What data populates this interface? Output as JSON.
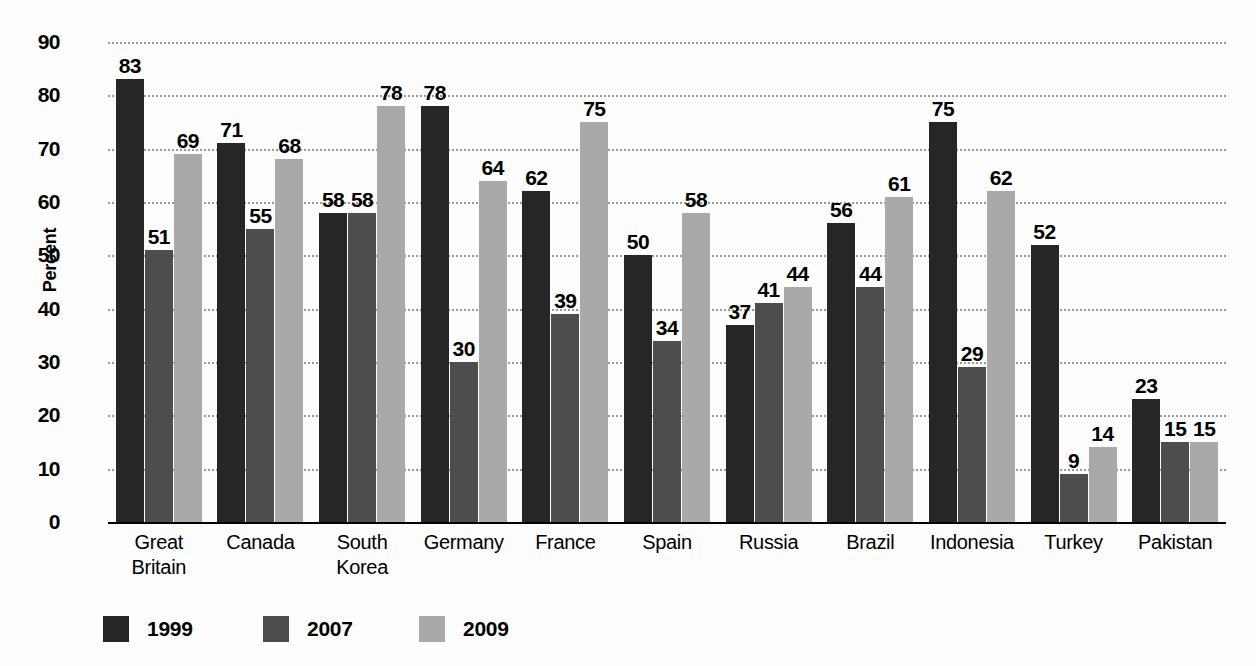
{
  "chart_data": {
    "type": "bar",
    "title": "",
    "xlabel": "",
    "ylabel": "Percent",
    "ylim": [
      0,
      90
    ],
    "ytick_step": 10,
    "yticks": [
      90,
      80,
      70,
      60,
      50,
      40,
      30,
      20,
      10,
      0
    ],
    "grid": true,
    "grid_style": "dotted-horizontal",
    "legend_position": "bottom-left",
    "categories": [
      "Great Britain",
      "Canada",
      "South Korea",
      "Germany",
      "France",
      "Spain",
      "Russia",
      "Brazil",
      "Indonesia",
      "Turkey",
      "Pakistan"
    ],
    "category_lines": [
      [
        "Great",
        "Britain"
      ],
      [
        "Canada"
      ],
      [
        "South",
        "Korea"
      ],
      [
        "Germany"
      ],
      [
        "France"
      ],
      [
        "Spain"
      ],
      [
        "Russia"
      ],
      [
        "Brazil"
      ],
      [
        "Indonesia"
      ],
      [
        "Turkey"
      ],
      [
        "Pakistan"
      ]
    ],
    "series": [
      {
        "name": "1999",
        "color": "#262626",
        "values": [
          83,
          71,
          58,
          78,
          62,
          50,
          37,
          56,
          75,
          52,
          23
        ]
      },
      {
        "name": "2007",
        "color": "#4d4d4d",
        "values": [
          51,
          55,
          58,
          30,
          39,
          34,
          41,
          44,
          29,
          9,
          15
        ]
      },
      {
        "name": "2009",
        "color": "#a9a9a9",
        "values": [
          69,
          68,
          78,
          64,
          75,
          58,
          44,
          61,
          62,
          14,
          15
        ]
      }
    ]
  },
  "legend": {
    "items": [
      {
        "label": "1999",
        "color": "#262626"
      },
      {
        "label": "2007",
        "color": "#4d4d4d"
      },
      {
        "label": "2009",
        "color": "#a9a9a9"
      }
    ]
  },
  "axis": {
    "y_title": "Percent"
  }
}
